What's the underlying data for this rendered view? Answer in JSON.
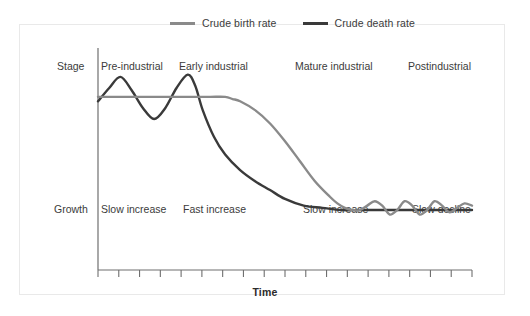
{
  "figure": {
    "background": "#ffffff",
    "frame_color": "#e9e9e9"
  },
  "legend": {
    "position": "top-center",
    "items": [
      {
        "label": "Crude birth rate",
        "color": "#8a8a8a",
        "swatch_name": "birth-rate-swatch"
      },
      {
        "label": "Crude death rate",
        "color": "#3a3a3a",
        "swatch_name": "death-rate-swatch"
      }
    ]
  },
  "rows": {
    "stage_label": "Stage",
    "growth_label": "Growth"
  },
  "axes": {
    "x_title": "Time",
    "tick_count": 19,
    "axis_color": "#6f6f6f"
  },
  "chart_data": {
    "type": "line",
    "title": "",
    "subtitle": "",
    "xlabel": "Time",
    "ylabel": "",
    "xlim": [
      0,
      100
    ],
    "ylim": [
      0,
      100
    ],
    "grid": false,
    "legend_position": "top-center",
    "annotations": {
      "stage": [
        {
          "text": "Pre-industrial",
          "x_start": 0,
          "x_end": 23
        },
        {
          "text": "Early industrial",
          "x_start": 23,
          "x_end": 50
        },
        {
          "text": "Mature industrial",
          "x_start": 50,
          "x_end": 76
        },
        {
          "text": "Postindustrial",
          "x_start": 76,
          "x_end": 100
        }
      ],
      "growth": [
        {
          "text": "Slow increase",
          "x_start": 0,
          "x_end": 23
        },
        {
          "text": "Fast increase",
          "x_start": 23,
          "x_end": 50
        },
        {
          "text": "Slow increase",
          "x_start": 50,
          "x_end": 76
        },
        {
          "text": "Slow decline",
          "x_start": 76,
          "x_end": 100
        }
      ]
    },
    "series": [
      {
        "name": "Crude birth rate",
        "color": "#8a8a8a",
        "x": [
          0,
          5,
          10,
          15,
          20,
          25,
          30,
          34,
          36,
          38,
          42,
          46,
          50,
          54,
          58,
          62,
          64,
          66,
          68,
          70,
          72,
          74,
          76,
          78,
          80,
          82,
          84,
          86,
          88,
          90,
          92,
          94,
          96,
          98,
          100
        ],
        "y": [
          78,
          78,
          78,
          78,
          78,
          78,
          78,
          78,
          77,
          76,
          72,
          66,
          58,
          49,
          40,
          33,
          30,
          28,
          27,
          27,
          29,
          31,
          29,
          25,
          27,
          31,
          29,
          25,
          27,
          31,
          29,
          26,
          28,
          30,
          29
        ]
      },
      {
        "name": "Crude death rate",
        "color": "#3a3a3a",
        "x": [
          0,
          3,
          6,
          9,
          12,
          15,
          18,
          21,
          24,
          26,
          28,
          31,
          34,
          38,
          42,
          46,
          50,
          55,
          60,
          65,
          70,
          75,
          80,
          85,
          90,
          95,
          100
        ],
        "y": [
          76,
          82,
          87,
          81,
          73,
          68,
          73,
          82,
          88,
          83,
          72,
          60,
          52,
          45,
          40,
          36,
          32,
          29,
          28,
          27,
          27,
          27,
          27,
          27,
          27,
          27,
          27
        ]
      }
    ]
  }
}
